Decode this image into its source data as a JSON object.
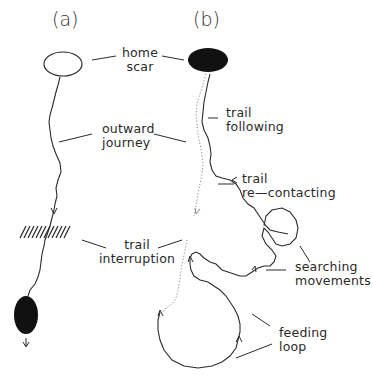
{
  "panels": [
    {
      "id": "a",
      "label": "(a)"
    },
    {
      "id": "b",
      "label": "(b)"
    }
  ],
  "labels": {
    "home_scar": [
      "home",
      "scar"
    ],
    "outward_journey": [
      "outward",
      "journey"
    ],
    "trail_interruption": [
      "trail",
      "interruption"
    ],
    "trail_following": [
      "trail",
      "following"
    ],
    "trail_recontacting": [
      "trail",
      "re—contacting"
    ],
    "searching_movements": [
      "searching",
      "movements"
    ],
    "feeding_loop": [
      "feeding",
      "loop"
    ]
  },
  "colors": {
    "line": "#2b2b2b",
    "dotted": "#8a8a8a",
    "fill": "#111111",
    "text": "#2a2a2a"
  }
}
